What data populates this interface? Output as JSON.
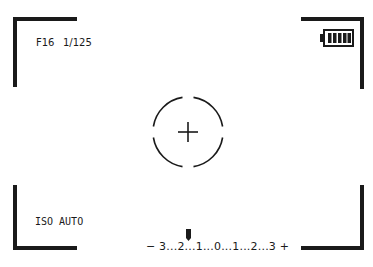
{
  "viewfinder": {
    "aperture": "F16",
    "shutter": "1/125",
    "iso": "ISO AUTO",
    "exposure_scale": "− 3...2...1...0...1...2...3 +",
    "exposure_value": 0,
    "battery_bars": 5,
    "icons": [
      "battery-full-icon",
      "focus-reticle-icon",
      "exposure-marker-icon"
    ]
  }
}
